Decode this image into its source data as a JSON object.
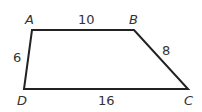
{
  "figure": {
    "type": "quadrilateral",
    "stroke_color": "#222222",
    "vertices": [
      {
        "name": "A",
        "x": 32,
        "y": 30
      },
      {
        "name": "B",
        "x": 134,
        "y": 30
      },
      {
        "name": "C",
        "x": 188,
        "y": 89
      },
      {
        "name": "D",
        "x": 24,
        "y": 89
      }
    ],
    "labels": {
      "A": "A",
      "B": "B",
      "C": "C",
      "D": "D"
    },
    "sides": {
      "AB": "10",
      "BC": "8",
      "DC": "16",
      "AD": "6"
    }
  }
}
